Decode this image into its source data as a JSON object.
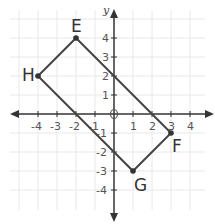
{
  "diagram": {
    "type": "coordinate-plane-quadrilateral",
    "axes": {
      "x_label": "x",
      "y_label": "y",
      "x_ticks": [
        "-4",
        "-3",
        "-2",
        "-1",
        "1",
        "2",
        "3",
        "4"
      ],
      "y_ticks": [
        "4",
        "3",
        "2",
        "1",
        "-1",
        "-2",
        "-3",
        "-4"
      ],
      "origin_marker": "0"
    },
    "points": [
      {
        "name": "E",
        "x": -2,
        "y": 4
      },
      {
        "name": "F",
        "x": 3,
        "y": -1
      },
      {
        "name": "G",
        "x": 1,
        "y": -3
      },
      {
        "name": "H",
        "x": -4,
        "y": 2
      }
    ],
    "polygon": "EFGH",
    "colors": {
      "grid": "#e6e6e6",
      "axis": "#333333",
      "shape": "#444444"
    }
  }
}
